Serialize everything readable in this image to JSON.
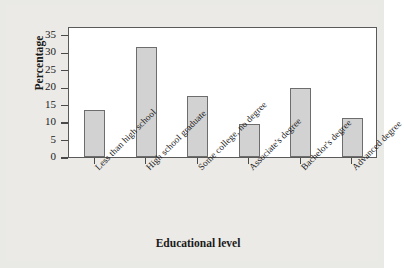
{
  "chart_data": {
    "type": "bar",
    "title": "",
    "xlabel": "Educational level",
    "ylabel": "Percentage",
    "categories": [
      "Less than high school",
      "High school graduate",
      "Some college, no degree",
      "Associate's degree",
      "Bachelor's degree",
      "Advanced degree"
    ],
    "values": [
      13.5,
      31.4,
      17.4,
      9.4,
      19.7,
      11.2
    ],
    "yticks": [
      0,
      5,
      10,
      15,
      20,
      25,
      30,
      35
    ],
    "ylim": [
      0,
      37.5
    ],
    "grid": false,
    "legend": false,
    "bar_fill_color": "#d2d2d2",
    "bar_edge_color": "#6d6d6d",
    "axis_color": "#5a5a5a",
    "plot_background": "#ffffff",
    "figure_background": "#eceae6"
  }
}
